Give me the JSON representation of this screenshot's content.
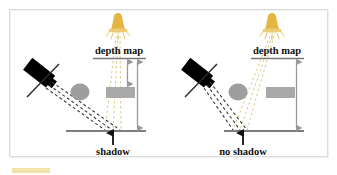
{
  "figure": {
    "title": "",
    "background_color": "#ffffff",
    "frame_color": "#d9d9d9",
    "frame_rect": {
      "x": 9,
      "y": 9,
      "w": 319,
      "h": 148
    },
    "highlight_bar": {
      "color": "#f2e3ac",
      "x": 12,
      "y": 168,
      "w": 38,
      "h": 5
    }
  },
  "colors": {
    "camera_black": "#000000",
    "object_gray": "#9e9e9e",
    "box_gray": "#a8a8a8",
    "ground_gray": "#808080",
    "arrow_gray": "#9a9a9a",
    "depth_line_gray": "#7a7a7a",
    "light_yellow": "#e0b83c",
    "light_ray_yellow": "#d9cc8e",
    "camera_ray_dark": "#3a3a3a",
    "text_black": "#111111"
  },
  "panels": [
    {
      "id": "left-panel",
      "name": "shadow-case",
      "title": "depth map",
      "caption": "shadow",
      "light_source": {
        "name": "light-bulb-icon",
        "x": 118,
        "y": 24
      },
      "camera": {
        "name": "camera-icon",
        "x": 40,
        "y": 74
      },
      "sphere": {
        "name": "sphere-object",
        "cx": 80,
        "cy": 92
      },
      "box": {
        "name": "box-object",
        "x": 107,
        "y": 87,
        "w": 28,
        "h": 11
      },
      "ground_line": {
        "x1": 66,
        "y1": 131,
        "x2": 146,
        "y2": 131
      },
      "depth_map_line": {
        "x1": 94,
        "y1": 58,
        "x2": 146,
        "y2": 58
      },
      "measure_arrows": [
        {
          "name": "depth-arrow-short",
          "x": 127,
          "y1": 60,
          "y2": 85,
          "label": ""
        },
        {
          "name": "depth-arrow-long",
          "x": 137,
          "y1": 60,
          "y2": 129,
          "label": ""
        }
      ],
      "caption_arrow": {
        "name": "shadow-pointer-arrow",
        "x": 113,
        "y1": 144,
        "y2": 131
      }
    },
    {
      "id": "right-panel",
      "name": "no-shadow-case",
      "title": "depth map",
      "caption": "no shadow",
      "light_source": {
        "name": "light-bulb-icon",
        "x": 272,
        "y": 24
      },
      "camera": {
        "name": "camera-icon",
        "x": 198,
        "y": 74
      },
      "sphere": {
        "name": "sphere-object",
        "cx": 238,
        "cy": 92
      },
      "box": {
        "name": "box-object",
        "x": 267,
        "y": 87,
        "w": 28,
        "h": 11
      },
      "ground_line": {
        "x1": 224,
        "y1": 131,
        "x2": 304,
        "y2": 131
      },
      "depth_map_line": {
        "x1": 251,
        "y1": 58,
        "x2": 304,
        "y2": 58
      },
      "measure_arrows": [
        {
          "name": "depth-arrow-long",
          "x": 296,
          "y1": 60,
          "y2": 129,
          "label": ""
        }
      ],
      "caption_arrow": {
        "name": "no-shadow-pointer-arrow",
        "x": 243,
        "y1": 144,
        "y2": 131
      }
    }
  ],
  "labels": {
    "depth_map_left": "depth map",
    "depth_map_right": "depth map",
    "caption_left": "shadow",
    "caption_right": "no shadow"
  }
}
